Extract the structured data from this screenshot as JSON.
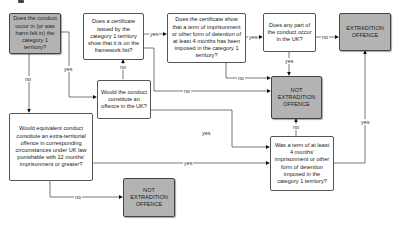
{
  "diagram": {
    "type": "flowchart",
    "colors": {
      "terminal_fill": "#b3b3b3",
      "decision_fill": "#ffffff",
      "line": "#555555"
    },
    "nodes": {
      "conduct_in_territory": "Does the conduct occur in (or was harm felt in) the category 1 territory?",
      "certificate_framework": "Does a certificate issued by the category 1 territory show that it is on the framework list?",
      "certificate_term": "Does the certificate show that a term of imprisonment or other form of detention of at least  4 months has been imposed in the category 1 territory?",
      "any_part_uk": "Does any part of the conduct occur in the UK?",
      "extradition_offence": "EXTRADITION OFFENCE",
      "offence_in_uk": "Would the conduct constitute an offence in the UK?",
      "not_extradition_mid": "NOT EXTRADITION OFFENCE",
      "extra_territorial": "Would equivalent conduct constitute an extra-territorial offence in corresponding circumstances under UK law punishable with 12 months' imprisonment or greater?",
      "term_imposed": "Was a term of at least 4 months' imprisonment or other form of detention imposed in the category 1 territory?",
      "not_extradition_bottom": "NOT EXTRADITION OFFENCE"
    },
    "edges": {
      "a_no": "no",
      "a_yes": "yes",
      "b_yes": "yes",
      "b_no_down": "no",
      "b_no_right": "no",
      "c_yes": "yes",
      "c_no": "no",
      "d_no": "no",
      "d_yes": "yes",
      "f_yes": "yes",
      "h_yes": "yes",
      "h_no": "no",
      "i_no": "no",
      "i_yes": "yes"
    }
  }
}
